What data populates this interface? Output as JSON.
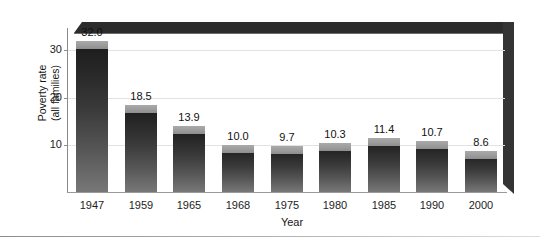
{
  "chart_data": {
    "type": "bar",
    "title": "",
    "xlabel": "Year",
    "ylabel": "Poverty rate\n(all families)",
    "ylabel_line1": "Poverty rate",
    "ylabel_line2": "(all families)",
    "categories": [
      "1947",
      "1959",
      "1965",
      "1968",
      "1975",
      "1980",
      "1985",
      "1990",
      "2000"
    ],
    "values": [
      32.0,
      18.5,
      13.9,
      10.0,
      9.7,
      10.3,
      11.4,
      10.7,
      8.6
    ],
    "value_labels": [
      "32.0",
      "18.5",
      "13.9",
      "10.0",
      "9.7",
      "10.3",
      "11.4",
      "10.7",
      "8.6"
    ],
    "ylim": [
      0,
      35
    ],
    "yticks": [
      10,
      20,
      30
    ],
    "ytick_labels": [
      "10",
      "20",
      "30"
    ],
    "grid": true,
    "legend": "none",
    "series": [
      {
        "name": "Poverty rate (all families)",
        "values": [
          32.0,
          18.5,
          13.9,
          10.0,
          9.7,
          10.3,
          11.4,
          10.7,
          8.6
        ]
      }
    ],
    "bar_color_top": "#1b1b1b",
    "bar_color_bottom": "#777777",
    "bar_cap_color": "#9c9c9c",
    "frame_color": "#2c2c2c",
    "gridline_color": "#e2e2e2",
    "axis_color": "#8b8b8b"
  }
}
